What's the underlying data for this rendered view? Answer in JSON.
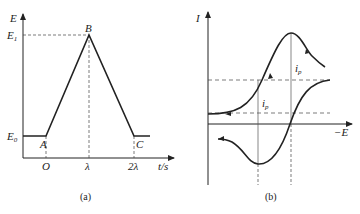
{
  "figure_a": {
    "y_label": "E",
    "x_label": "t/s",
    "y_ticks": [
      "E1",
      "E0"
    ],
    "x_ticks": [
      "O",
      "λ",
      "2λ"
    ],
    "points": [
      "A",
      "B",
      "C"
    ],
    "caption": "(a)",
    "waveform": {
      "type": "triangular potential sweep",
      "segments": [
        {
          "from": "E0 (before A)",
          "to": "A",
          "shape": "flat"
        },
        {
          "from": "A",
          "to": "B",
          "shape": "linear rise to E1 at t=λ"
        },
        {
          "from": "B",
          "to": "C",
          "shape": "linear fall to E0 at t=2λ"
        },
        {
          "from": "C",
          "to": "after",
          "shape": "flat"
        }
      ]
    }
  },
  "figure_b": {
    "y_label": "I",
    "x_label": "−E",
    "peak_labels": [
      "ip",
      "ip"
    ],
    "caption": "(b)",
    "description": "cyclic voltammogram with cathodic and anodic peaks, dashed baselines and peak potential markers"
  },
  "colors": {
    "line": "#222222",
    "dashed": "#444444",
    "background": "#ffffff"
  }
}
